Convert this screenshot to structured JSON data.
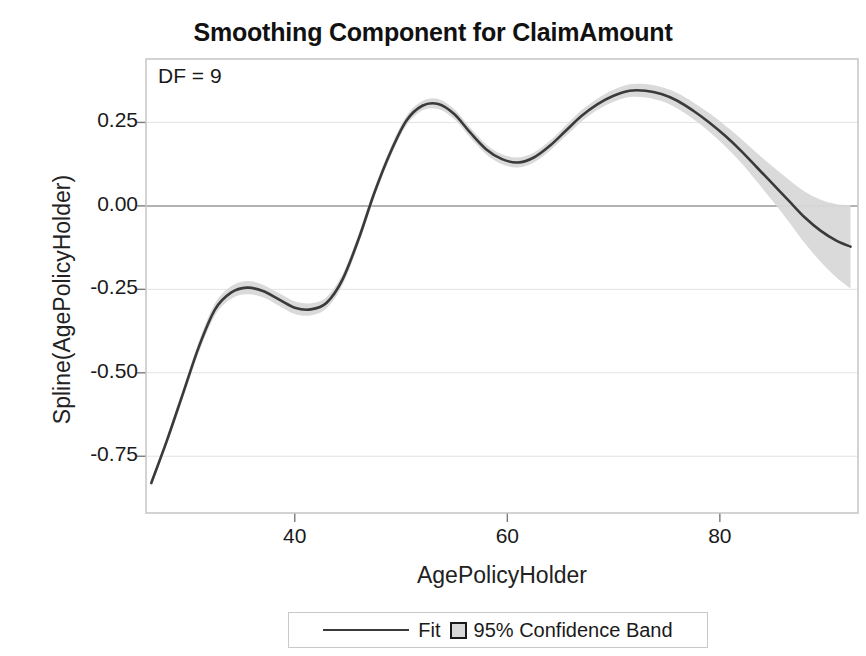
{
  "chart_data": {
    "type": "line",
    "title": "Smoothing Component for ClaimAmount",
    "xlabel": "AgePolicyHolder",
    "ylabel": "Spline(AgePolicyHolder)",
    "annotation": "DF = 9",
    "xlim": [
      26,
      93
    ],
    "ylim": [
      -0.92,
      0.44
    ],
    "xticks": [
      40,
      60,
      80
    ],
    "xtick_labels": [
      "40",
      "60",
      "80"
    ],
    "yticks": [
      0.25,
      0.0,
      -0.25,
      -0.5,
      -0.75
    ],
    "ytick_labels": [
      "0.25",
      "0.00",
      "-0.25",
      "-0.50",
      "-0.75"
    ],
    "grid": "horizontal",
    "zero_reference_line": true,
    "legend_position": "bottom-outside",
    "legend": [
      {
        "label": "Fit",
        "marker": "line",
        "color": "#3a3a3a"
      },
      {
        "label": "95% Confidence Band",
        "marker": "square",
        "color": "#d8d8d8"
      }
    ],
    "series": [
      {
        "name": "Fit",
        "color": "#3a3a3a",
        "x": [
          26.5,
          28,
          29.5,
          31,
          32.5,
          34,
          35.5,
          37,
          38.5,
          40,
          41.5,
          43,
          44.5,
          46,
          47.5,
          49,
          50.5,
          52,
          53.5,
          55,
          56.5,
          58,
          59.5,
          61,
          62.5,
          64,
          65.5,
          67,
          68.5,
          70,
          71.5,
          73,
          74.5,
          76,
          77.5,
          79,
          80.5,
          82,
          83.5,
          85,
          86.5,
          88,
          89.5,
          91,
          92.3
        ],
        "y": [
          -0.83,
          -0.7,
          -0.56,
          -0.42,
          -0.31,
          -0.26,
          -0.245,
          -0.255,
          -0.28,
          -0.305,
          -0.31,
          -0.29,
          -0.22,
          -0.1,
          0.04,
          0.16,
          0.255,
          0.3,
          0.305,
          0.275,
          0.22,
          0.17,
          0.14,
          0.13,
          0.145,
          0.18,
          0.225,
          0.27,
          0.305,
          0.33,
          0.345,
          0.345,
          0.335,
          0.315,
          0.285,
          0.25,
          0.21,
          0.165,
          0.115,
          0.065,
          0.015,
          -0.035,
          -0.075,
          -0.105,
          -0.122
        ]
      },
      {
        "name": "95% Confidence Band",
        "color": "#d8d8d8",
        "x": [
          26.5,
          28,
          29.5,
          31,
          32.5,
          34,
          35.5,
          37,
          38.5,
          40,
          41.5,
          43,
          44.5,
          46,
          47.5,
          49,
          50.5,
          52,
          53.5,
          55,
          56.5,
          58,
          59.5,
          61,
          62.5,
          64,
          65.5,
          67,
          68.5,
          70,
          71.5,
          73,
          74.5,
          76,
          77.5,
          79,
          80.5,
          82,
          83.5,
          85,
          86.5,
          88,
          89.5,
          91,
          92.3
        ],
        "half_width": [
          0.01,
          0.012,
          0.014,
          0.016,
          0.018,
          0.019,
          0.02,
          0.019,
          0.019,
          0.019,
          0.018,
          0.017,
          0.016,
          0.015,
          0.014,
          0.014,
          0.014,
          0.014,
          0.015,
          0.015,
          0.015,
          0.015,
          0.015,
          0.015,
          0.015,
          0.015,
          0.016,
          0.017,
          0.017,
          0.018,
          0.019,
          0.02,
          0.021,
          0.023,
          0.025,
          0.028,
          0.031,
          0.036,
          0.043,
          0.052,
          0.063,
          0.077,
          0.093,
          0.11,
          0.125
        ]
      }
    ]
  },
  "colors": {
    "fit_line": "#3a3a3a",
    "band": "#d8d8d8",
    "grid": "#e3e3e3",
    "zero_line": "#9a9a9a",
    "frame": "#c9c9c9",
    "background": "#ffffff"
  }
}
